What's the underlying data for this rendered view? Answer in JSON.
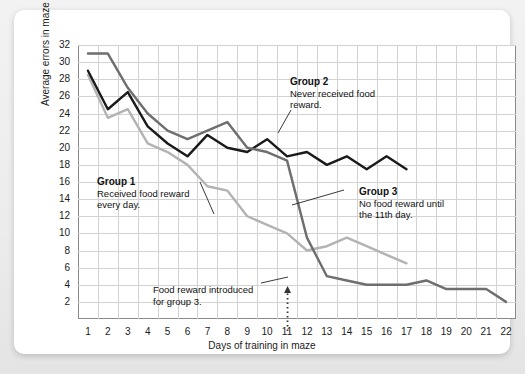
{
  "chart_data": {
    "type": "line",
    "title": "",
    "xlabel": "Days of training in maze",
    "ylabel": "Average errors in maze",
    "xlim": [
      0.5,
      22.5
    ],
    "ylim": [
      0,
      32
    ],
    "yticks": [
      2,
      4,
      6,
      8,
      10,
      12,
      14,
      16,
      18,
      20,
      22,
      24,
      26,
      28,
      30,
      32
    ],
    "xticks": [
      1,
      2,
      3,
      4,
      5,
      6,
      7,
      8,
      9,
      10,
      11,
      12,
      13,
      14,
      15,
      16,
      17,
      18,
      19,
      20,
      21,
      22
    ],
    "grid": true,
    "legend_position": "inline-annotations",
    "x": [
      1,
      2,
      3,
      4,
      5,
      6,
      7,
      8,
      9,
      10,
      11,
      12,
      13,
      14,
      15,
      16,
      17,
      18,
      19,
      20,
      21,
      22
    ],
    "series": [
      {
        "name": "Group 1",
        "color": "#b3b3b3",
        "description": "Received food reward every day.",
        "x": [
          1,
          2,
          3,
          4,
          5,
          6,
          7,
          8,
          9,
          10,
          11,
          12,
          13,
          14,
          15,
          16,
          17
        ],
        "values": [
          28.5,
          23.5,
          24.5,
          20.5,
          19.5,
          18.0,
          15.5,
          15.0,
          12.0,
          11.0,
          10.0,
          8.0,
          8.5,
          9.5,
          8.5,
          7.5,
          6.5
        ]
      },
      {
        "name": "Group 2",
        "color": "#1a1a1a",
        "description": "Never received food reward.",
        "x": [
          1,
          2,
          3,
          4,
          5,
          6,
          7,
          8,
          9,
          10,
          11,
          12,
          13,
          14,
          15,
          16,
          17
        ],
        "values": [
          29.0,
          24.5,
          26.5,
          22.5,
          20.5,
          19.0,
          21.5,
          20.0,
          19.5,
          21.0,
          19.0,
          19.5,
          18.0,
          19.0,
          17.5,
          19.0,
          17.5
        ]
      },
      {
        "name": "Group 3",
        "color": "#6e6e6e",
        "description": "No food reward until the 11th day.",
        "x": [
          1,
          2,
          3,
          4,
          5,
          6,
          7,
          8,
          9,
          10,
          11,
          12,
          13,
          14,
          15,
          16,
          17,
          18,
          19,
          20,
          21,
          22
        ],
        "values": [
          31.0,
          31.0,
          27.0,
          24.0,
          22.0,
          21.0,
          22.0,
          23.0,
          20.0,
          19.5,
          18.5,
          9.5,
          5.0,
          4.5,
          4.0,
          4.0,
          4.0,
          4.5,
          3.5,
          3.5,
          3.5,
          2.0
        ]
      }
    ],
    "annotations": [
      {
        "id": "group-1",
        "header": "Group 1",
        "body_line1": "Received food reward",
        "body_line2": "every day."
      },
      {
        "id": "group-2",
        "header": "Group 2",
        "body_line1": "Never received food",
        "body_line2": "reward."
      },
      {
        "id": "group-3",
        "header": "Group 3",
        "body_line1": "No food reward until",
        "body_line2": "the 11th day."
      },
      {
        "id": "food-reward-introduced",
        "header": "",
        "body_line1": "Food reward introduced",
        "body_line2": "for group 3."
      }
    ],
    "marker_event": {
      "label": "Food reward introduced for group 3.",
      "day": 11,
      "style": "dotted-arrow-up"
    }
  },
  "axes": {
    "y_label": "Average errors in maze",
    "x_label": "Days of training in maze",
    "y_ticks": [
      "2",
      "4",
      "6",
      "8",
      "10",
      "12",
      "14",
      "16",
      "18",
      "20",
      "22",
      "24",
      "26",
      "28",
      "30",
      "32"
    ],
    "x_ticks": [
      "1",
      "2",
      "3",
      "4",
      "5",
      "6",
      "7",
      "8",
      "9",
      "10",
      "11",
      "12",
      "13",
      "14",
      "15",
      "16",
      "17",
      "18",
      "19",
      "20",
      "21",
      "22"
    ]
  },
  "colors": {
    "group1": "#b3b3b3",
    "group2": "#1a1a1a",
    "group3": "#6e6e6e",
    "grid": "#d2d2d2",
    "frame": "#8a8a8a",
    "card": "#ffffff",
    "backdrop": "#ececec"
  }
}
